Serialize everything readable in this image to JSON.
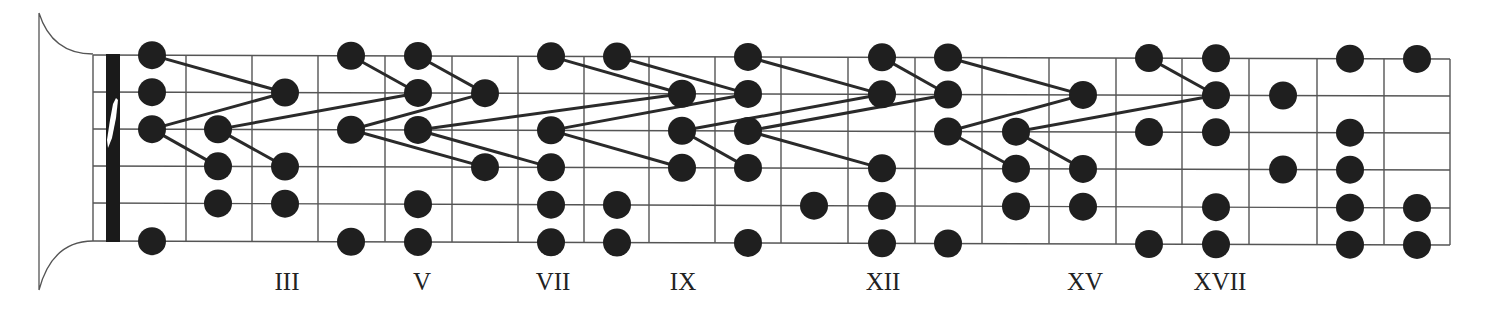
{
  "diagram": {
    "colors": {
      "background": "#ffffff",
      "line": "#555555",
      "dot": "#1f1f1f",
      "connector": "#2a2a2a",
      "nut": "#1a1a1a"
    },
    "geometry": {
      "string_y_left": [
        55,
        92,
        129,
        166,
        203,
        241
      ],
      "string_y_right": [
        59,
        96,
        133,
        170,
        208,
        245
      ],
      "board_left": 93,
      "board_right": 1450,
      "nut_left": 106,
      "nut_right": 120,
      "fret_x": [
        186,
        252,
        318,
        385,
        452,
        518,
        584,
        649,
        715,
        781,
        848,
        915,
        982,
        1049,
        1116,
        1182,
        1249,
        1317,
        1384,
        1450
      ],
      "dot_radius": 14
    },
    "fret_labels": [
      {
        "text": "III",
        "x": 287
      },
      {
        "text": "V",
        "x": 422
      },
      {
        "text": "VII",
        "x": 553
      },
      {
        "text": "IX",
        "x": 683
      },
      {
        "text": "XII",
        "x": 883
      },
      {
        "text": "XV",
        "x": 1085
      },
      {
        "text": "XVII",
        "x": 1220
      }
    ],
    "dots": [
      [
        152,
        1
      ],
      [
        152,
        2
      ],
      [
        152,
        3
      ],
      [
        152,
        6
      ],
      [
        218,
        3
      ],
      [
        218,
        4
      ],
      [
        218,
        5
      ],
      [
        285,
        2
      ],
      [
        285,
        4
      ],
      [
        285,
        5
      ],
      [
        351,
        1
      ],
      [
        351,
        3
      ],
      [
        351,
        6
      ],
      [
        418,
        1
      ],
      [
        418,
        2
      ],
      [
        418,
        3
      ],
      [
        418,
        5
      ],
      [
        418,
        6
      ],
      [
        485,
        2
      ],
      [
        485,
        4
      ],
      [
        551,
        1
      ],
      [
        551,
        3
      ],
      [
        551,
        4
      ],
      [
        551,
        5
      ],
      [
        551,
        6
      ],
      [
        617,
        1
      ],
      [
        617,
        5
      ],
      [
        617,
        6
      ],
      [
        682,
        2
      ],
      [
        682,
        3
      ],
      [
        682,
        4
      ],
      [
        748,
        1
      ],
      [
        748,
        2
      ],
      [
        748,
        3
      ],
      [
        748,
        4
      ],
      [
        748,
        6
      ],
      [
        814,
        5
      ],
      [
        882,
        1
      ],
      [
        882,
        2
      ],
      [
        882,
        4
      ],
      [
        882,
        5
      ],
      [
        882,
        6
      ],
      [
        948,
        1
      ],
      [
        948,
        2
      ],
      [
        948,
        3
      ],
      [
        948,
        6
      ],
      [
        1016,
        3
      ],
      [
        1016,
        4
      ],
      [
        1016,
        5
      ],
      [
        1083,
        2
      ],
      [
        1083,
        4
      ],
      [
        1083,
        5
      ],
      [
        1149,
        1
      ],
      [
        1149,
        3
      ],
      [
        1149,
        6
      ],
      [
        1216,
        1
      ],
      [
        1216,
        2
      ],
      [
        1216,
        3
      ],
      [
        1216,
        5
      ],
      [
        1216,
        6
      ],
      [
        1283,
        2
      ],
      [
        1283,
        4
      ],
      [
        1350,
        1
      ],
      [
        1350,
        3
      ],
      [
        1350,
        4
      ],
      [
        1350,
        5
      ],
      [
        1350,
        6
      ],
      [
        1417,
        1
      ],
      [
        1417,
        5
      ],
      [
        1417,
        6
      ]
    ],
    "connectors": [
      [
        [
          152,
          1
        ],
        [
          285,
          2
        ]
      ],
      [
        [
          152,
          3
        ],
        [
          285,
          2
        ]
      ],
      [
        [
          152,
          3
        ],
        [
          218,
          4
        ]
      ],
      [
        [
          218,
          3
        ],
        [
          418,
          2
        ]
      ],
      [
        [
          218,
          3
        ],
        [
          285,
          4
        ]
      ],
      [
        [
          351,
          1
        ],
        [
          418,
          2
        ]
      ],
      [
        [
          418,
          1
        ],
        [
          485,
          2
        ]
      ],
      [
        [
          351,
          3
        ],
        [
          485,
          2
        ]
      ],
      [
        [
          351,
          3
        ],
        [
          485,
          4
        ]
      ],
      [
        [
          418,
          3
        ],
        [
          551,
          4
        ]
      ],
      [
        [
          418,
          3
        ],
        [
          682,
          2
        ]
      ],
      [
        [
          551,
          1
        ],
        [
          682,
          2
        ]
      ],
      [
        [
          617,
          1
        ],
        [
          748,
          2
        ]
      ],
      [
        [
          551,
          3
        ],
        [
          748,
          2
        ]
      ],
      [
        [
          551,
          3
        ],
        [
          682,
          4
        ]
      ],
      [
        [
          682,
          3
        ],
        [
          748,
          4
        ]
      ],
      [
        [
          682,
          3
        ],
        [
          882,
          2
        ]
      ],
      [
        [
          748,
          1
        ],
        [
          882,
          2
        ]
      ],
      [
        [
          882,
          1
        ],
        [
          948,
          2
        ]
      ],
      [
        [
          748,
          3
        ],
        [
          948,
          2
        ]
      ],
      [
        [
          748,
          3
        ],
        [
          882,
          4
        ]
      ],
      [
        [
          948,
          1
        ],
        [
          1083,
          2
        ]
      ],
      [
        [
          948,
          3
        ],
        [
          1083,
          2
        ]
      ],
      [
        [
          948,
          3
        ],
        [
          1016,
          4
        ]
      ],
      [
        [
          1016,
          3
        ],
        [
          1216,
          2
        ]
      ],
      [
        [
          1016,
          3
        ],
        [
          1083,
          4
        ]
      ],
      [
        [
          1149,
          1
        ],
        [
          1216,
          2
        ]
      ]
    ]
  }
}
